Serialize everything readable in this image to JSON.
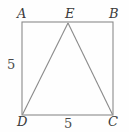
{
  "figure": {
    "background_color": "#fefefe",
    "line_color": "#808080",
    "label_color": "#3a3a3a",
    "vertices": {
      "A": "A",
      "B": "B",
      "C": "C",
      "D": "D",
      "E": "E"
    },
    "measures": {
      "left_side": "5",
      "bottom_side": "5"
    },
    "geometry": {
      "square": {
        "top_left": [
          22,
          22
        ],
        "top_right": [
          113,
          22
        ],
        "bottom_right": [
          113,
          115
        ],
        "bottom_left": [
          22,
          115
        ]
      },
      "apex_E": [
        68,
        23
      ],
      "triangle": [
        [
          22,
          115
        ],
        [
          68,
          23
        ],
        [
          113,
          115
        ]
      ]
    }
  }
}
